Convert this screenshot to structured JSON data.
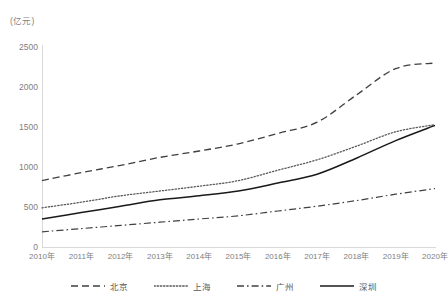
{
  "chart_data": {
    "type": "line",
    "title": "",
    "subtitle": "",
    "xlabel": "",
    "ylabel": "",
    "unit_label": "(亿元)",
    "grid": false,
    "legend_position": "bottom",
    "ylim": [
      0,
      2500
    ],
    "ytick_labels": [
      "0",
      "500",
      "1000",
      "1500",
      "2000",
      "2500"
    ],
    "ytick_values": [
      0,
      500,
      1000,
      1500,
      2000,
      2500
    ],
    "categories": [
      "2010年",
      "2011年",
      "2012年",
      "2013年",
      "2014年",
      "2015年",
      "2016年",
      "2017年",
      "2018年",
      "2019年",
      "2020年"
    ],
    "x": [
      2010,
      2011,
      2012,
      2013,
      2014,
      2015,
      2016,
      2017,
      2018,
      2019,
      2020
    ],
    "series": [
      {
        "name": "北京",
        "style": "dashed",
        "color": "#404040",
        "values": [
          830,
          930,
          1020,
          1120,
          1200,
          1290,
          1420,
          1560,
          1900,
          2230,
          2300
        ]
      },
      {
        "name": "上海",
        "style": "dotted",
        "color": "#595959",
        "values": [
          490,
          560,
          640,
          700,
          760,
          830,
          960,
          1090,
          1260,
          1440,
          1530
        ]
      },
      {
        "name": "广州",
        "style": "dash-dot",
        "color": "#404040",
        "values": [
          190,
          230,
          270,
          310,
          350,
          390,
          450,
          510,
          580,
          660,
          730
        ]
      },
      {
        "name": "深圳",
        "style": "solid",
        "color": "#1a1a1a",
        "values": [
          350,
          430,
          510,
          590,
          640,
          700,
          800,
          910,
          1110,
          1330,
          1520
        ]
      }
    ]
  },
  "legend": {
    "items": [
      {
        "label": "北京",
        "style": "dashed"
      },
      {
        "label": "上海",
        "style": "dotted"
      },
      {
        "label": "广州",
        "style": "dash-dot"
      },
      {
        "label": "深圳",
        "style": "solid"
      }
    ]
  }
}
